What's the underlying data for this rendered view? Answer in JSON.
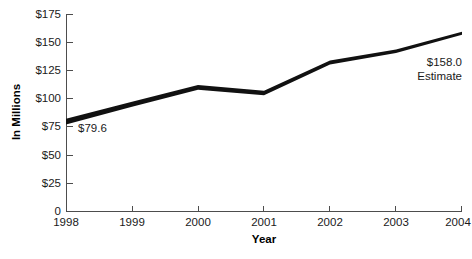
{
  "chart_data": {
    "type": "line",
    "title": "",
    "xlabel": "Year",
    "ylabel": "In Millions",
    "categories": [
      "1998",
      "1999",
      "2000",
      "2001",
      "2002",
      "2003",
      "2004"
    ],
    "x": [
      1998,
      1999,
      2000,
      2001,
      2002,
      2003,
      2004
    ],
    "values": [
      79.6,
      95.0,
      110.0,
      105.0,
      132.0,
      142.0,
      158.0
    ],
    "series": [
      {
        "name": "In Millions",
        "values": [
          79.6,
          95.0,
          110.0,
          105.0,
          132.0,
          142.0,
          158.0
        ],
        "color": "#111111"
      }
    ],
    "ylim": [
      0,
      175
    ],
    "ytick_values": [
      0,
      25,
      50,
      75,
      100,
      125,
      150,
      175
    ],
    "ytick_labels": [
      "0",
      "$25",
      "$50",
      "$75",
      "$100",
      "$125",
      "$150",
      "$175"
    ],
    "xtick_labels": [
      "1998",
      "1999",
      "2000",
      "2001",
      "2002",
      "2003",
      "2004"
    ],
    "grid": false,
    "legend": false,
    "annotations": [
      {
        "name": "start-value-label",
        "text": "$79.6",
        "x": 1998,
        "y": 79.6,
        "anchor": "start"
      },
      {
        "name": "end-value-label",
        "line1": "$158.0",
        "line2": "Estimate",
        "x": 2004,
        "y": 158.0,
        "anchor": "end"
      }
    ]
  },
  "axes": {
    "y_title": "In Millions",
    "x_title": "Year"
  },
  "labels": {
    "start_value": "$79.6",
    "end_value": "$158.0",
    "end_qualifier": "Estimate"
  },
  "footer": {
    "source_note": ""
  },
  "colors": {
    "line": "#111111",
    "axis": "#4d4d4d",
    "text": "#1a1a1a",
    "background": "#ffffff"
  }
}
